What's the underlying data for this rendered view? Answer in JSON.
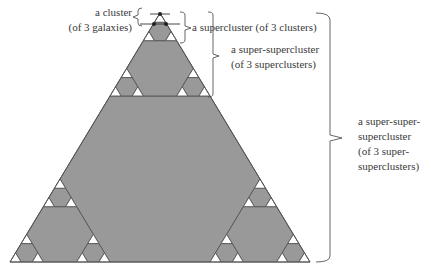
{
  "diagram": {
    "type": "hierarchical-triangle (Sierpinski-like cluster hierarchy)",
    "colors": {
      "fill": "#999999",
      "edge": "#555555",
      "corner_fill": "#ffffff",
      "bracket": "#555555",
      "text": "#3a3a3a"
    },
    "triangle": {
      "apex": [
        160,
        13
      ],
      "base_left": [
        10,
        262
      ],
      "base_right": [
        310,
        262
      ],
      "subdivision_levels": 3
    },
    "cluster_marker": {
      "dots": [
        [
          160,
          14
        ],
        [
          154,
          24
        ],
        [
          166,
          24
        ]
      ],
      "apex_line": [
        [
          150,
          14
        ],
        [
          170,
          14
        ]
      ],
      "base_line": [
        [
          140,
          24
        ],
        [
          180,
          24
        ]
      ]
    }
  },
  "labels": {
    "cluster": {
      "lines": [
        "a cluster",
        "(of 3 galaxies)"
      ]
    },
    "supercluster": {
      "lines": [
        "a supercluster (of 3 clusters)"
      ]
    },
    "super_supercluster": {
      "lines": [
        "a super-supercluster",
        "(of 3 superclusters)"
      ]
    },
    "super_super_supercluster": {
      "lines": [
        "a super-super-",
        "supercluster",
        "(of 3 super-",
        "superclusters)"
      ]
    }
  },
  "brackets": {
    "cluster": {
      "x": 138,
      "y1": 8,
      "y2": 26,
      "tick_y": 17,
      "side": "left"
    },
    "supercluster": {
      "x": 185,
      "y1": 12,
      "y2": 43,
      "tick_y": 28,
      "side": "right"
    },
    "super_supercluster": {
      "x": 213,
      "y1": 12,
      "y2": 97,
      "tick_y": 56,
      "side": "right"
    },
    "super_super_supercluster": {
      "x": 330,
      "y1": 14,
      "y2": 262,
      "tick_y": 138,
      "side": "right"
    }
  }
}
